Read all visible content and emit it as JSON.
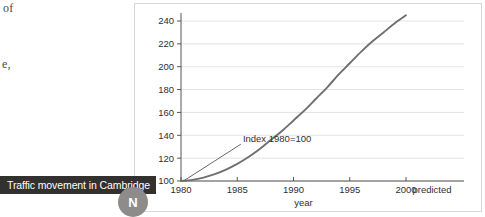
{
  "page_fragments": {
    "top": "of",
    "middle": "e,"
  },
  "caption": {
    "text": "Traffic movement in Cambridge",
    "badge_letter": "N",
    "bar_color": "#33312f",
    "badge_color": "#8e8c8a"
  },
  "chart_data": {
    "type": "line",
    "title": "",
    "xlabel": "year",
    "ylabel": "",
    "xlim": [
      1980,
      2000
    ],
    "ylim": [
      100,
      250
    ],
    "grid": true,
    "legend": null,
    "line_color": "#6f6f6f",
    "grid_color": "#e2e2e2",
    "axis_color": "#555555",
    "x_ticks": [
      1980,
      1985,
      1990,
      1995,
      2000
    ],
    "x_tick_labels": [
      "1980",
      "1985",
      "1990",
      "1995",
      "2000"
    ],
    "y_ticks": [
      100,
      120,
      140,
      160,
      180,
      200,
      220,
      240
    ],
    "y_tick_labels": [
      "100",
      "120",
      "140",
      "160",
      "180",
      "200",
      "220",
      "240"
    ],
    "annotations": [
      {
        "text": "Index 1980=100",
        "x": 1985.5,
        "y": 134,
        "leader_to_x": 1980.3,
        "leader_to_y": 100.5
      },
      {
        "text": "predicted",
        "x": 2000.4,
        "y": 96
      }
    ],
    "series": [
      {
        "name": "Traffic index",
        "x": [
          1980,
          1981,
          1982,
          1983,
          1984,
          1985,
          1986,
          1987,
          1988,
          1989,
          1990,
          1991,
          1992,
          1993,
          1994,
          1995,
          1996,
          1997,
          1998,
          1999,
          2000
        ],
        "values": [
          100,
          101,
          103,
          106,
          110,
          115,
          121,
          128,
          136,
          144,
          153,
          162,
          172,
          182,
          193,
          203,
          213,
          222,
          230,
          238,
          245
        ]
      }
    ]
  }
}
